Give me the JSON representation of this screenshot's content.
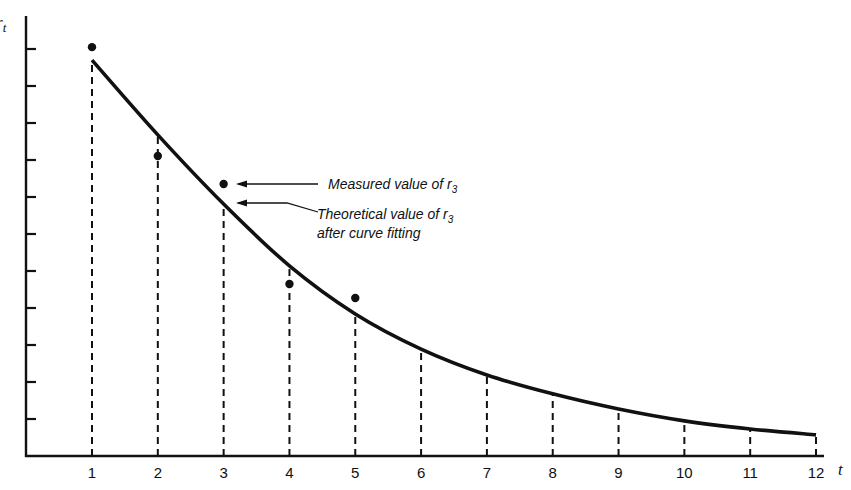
{
  "chart_data": {
    "type": "line",
    "title": "",
    "xlabel": "t",
    "ylabel": "r_t",
    "x": [
      1,
      2,
      3,
      4,
      5,
      6,
      7,
      8,
      9,
      10,
      11,
      12
    ],
    "xticks": [
      "1",
      "2",
      "3",
      "4",
      "5",
      "6",
      "7",
      "8",
      "9",
      "10",
      "11",
      "12"
    ],
    "y_tick_count": 11,
    "y_tick_labels": [],
    "xlim": [
      0,
      12.2
    ],
    "ylim": [
      0,
      11.8
    ],
    "grid": false,
    "legend": null,
    "series": [
      {
        "name": "Theoretical (fitted curve)",
        "style": "solid-line",
        "values": [
          10.7,
          8.68,
          6.81,
          5.14,
          3.84,
          2.89,
          2.19,
          1.68,
          1.27,
          0.95,
          0.73,
          0.57
        ]
      },
      {
        "name": "Measured values",
        "style": "dots",
        "x": [
          1,
          2,
          3,
          4,
          5
        ],
        "values": [
          11.05,
          8.11,
          7.35,
          4.65,
          4.27
        ]
      }
    ],
    "drop_lines": "dashed vertical lines from x-axis to curve at each integer t",
    "annotations": [
      {
        "text": "Measured value of r",
        "subscript": "3",
        "points_to": "measured dot at t=3"
      },
      {
        "text": "Theoretical value of r",
        "subscript": "3",
        "line2": "after curve fitting",
        "points_to": "curve at t=3"
      }
    ]
  },
  "labels": {
    "y_axis": "r",
    "y_axis_sub": "t",
    "x_axis": "t",
    "annot_measured": "Measured value of r",
    "annot_measured_sub": "3",
    "annot_theoretical_1": "Theoretical value of r",
    "annot_theoretical_sub": "3",
    "annot_theoretical_2": "after curve fitting"
  },
  "colors": {
    "ink": "#111111",
    "background": "#ffffff"
  }
}
